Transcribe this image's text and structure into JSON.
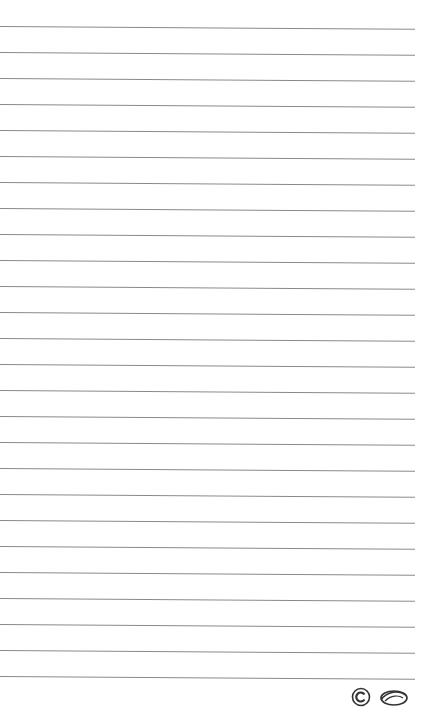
{
  "page": {
    "type": "lined-paper",
    "background": "#ffffff",
    "rule_color": "#8a8a8a",
    "rule_count": 26,
    "rule_start_y": 26,
    "rule_spacing": 26,
    "rule_width": 415
  },
  "footer": {
    "logos": [
      {
        "name": "circle-c-logo-icon"
      },
      {
        "name": "swirl-logo-icon"
      }
    ]
  }
}
